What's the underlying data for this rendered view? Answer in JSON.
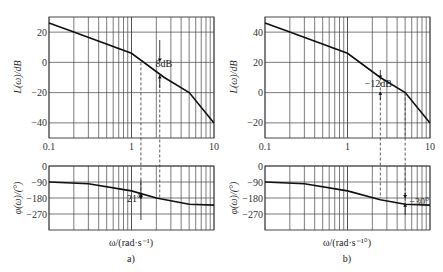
{
  "figure": {
    "panels": [
      {
        "label": "a)",
        "xaxis_label": "ω/(rad·s⁻¹)",
        "magnitude": {
          "ylabel": "L(ω)/dB",
          "yticks": [
            "20",
            "0",
            "-20",
            "-40"
          ],
          "annotation": "8dB"
        },
        "phase": {
          "ylabel": "φ(ω)/(°)",
          "yticks": [
            "0",
            "-90",
            "-180",
            "-270"
          ],
          "annotation": "21°"
        },
        "xticks": [
          "0.1",
          "1",
          "10"
        ]
      },
      {
        "label": "b)",
        "xaxis_label": "ω/(rad·s⁻¹°)",
        "magnitude": {
          "ylabel": "L(ω)/dB",
          "yticks": [
            "40",
            "20",
            "0",
            "-20"
          ],
          "annotation": "-12dB"
        },
        "phase": {
          "ylabel": "φ(ω)/(°)",
          "yticks": [
            "0",
            "-90",
            "-180",
            "-270"
          ],
          "annotation": "-30°"
        },
        "xticks": [
          "0.1",
          "1",
          "10"
        ]
      }
    ]
  },
  "chart_data": [
    {
      "type": "line",
      "title": "a) Bode magnitude",
      "xlabel": "ω/(rad·s⁻¹)",
      "ylabel": "L(ω)/dB",
      "xscale": "log",
      "xlim": [
        0.1,
        10
      ],
      "ylim": [
        -50,
        30
      ],
      "grid": true,
      "x": [
        0.1,
        0.2,
        1.0,
        2.5,
        5.0,
        10.0
      ],
      "series": [
        {
          "name": "L(ω)",
          "values": [
            26,
            20,
            6,
            -10,
            -20,
            -40
          ]
        }
      ],
      "annotations": [
        {
          "text": "8dB",
          "x": 2.2
        },
        {
          "text": "dashed lines at ω≈1.3 and ω≈2.2"
        }
      ]
    },
    {
      "type": "line",
      "title": "a) Bode phase",
      "xlabel": "ω/(rad·s⁻¹)",
      "ylabel": "φ(ω)/(°)",
      "xscale": "log",
      "xlim": [
        0.1,
        10
      ],
      "ylim": [
        -360,
        0
      ],
      "grid": true,
      "x": [
        0.1,
        0.3,
        1.0,
        2.0,
        5.0,
        10.0
      ],
      "series": [
        {
          "name": "φ(ω)",
          "values": [
            -90,
            -100,
            -140,
            -180,
            -215,
            -220
          ]
        }
      ],
      "annotations": [
        {
          "text": "21°",
          "x": 1.3
        }
      ]
    },
    {
      "type": "line",
      "title": "b) Bode magnitude",
      "xlabel": "ω/(rad·s⁻¹°)",
      "ylabel": "L(ω)/dB",
      "xscale": "log",
      "xlim": [
        0.1,
        10
      ],
      "ylim": [
        -30,
        50
      ],
      "grid": true,
      "x": [
        0.1,
        0.2,
        1.0,
        2.5,
        5.0,
        10.0
      ],
      "series": [
        {
          "name": "L(ω)",
          "values": [
            46,
            40,
            26,
            10,
            0,
            -20
          ]
        }
      ],
      "annotations": [
        {
          "text": "-12dB",
          "x": 2.5
        },
        {
          "text": "dashed lines at ω≈2.5 and ω≈5"
        }
      ]
    },
    {
      "type": "line",
      "title": "b) Bode phase",
      "xlabel": "ω/(rad·s⁻¹°)",
      "ylabel": "φ(ω)/(°)",
      "xscale": "log",
      "xlim": [
        0.1,
        10
      ],
      "ylim": [
        -360,
        0
      ],
      "grid": true,
      "x": [
        0.1,
        0.3,
        1.0,
        2.5,
        5.0,
        10.0
      ],
      "series": [
        {
          "name": "φ(ω)",
          "values": [
            -90,
            -100,
            -140,
            -190,
            -215,
            -220
          ]
        }
      ],
      "annotations": [
        {
          "text": "-30°",
          "x": 5.0
        }
      ]
    }
  ]
}
